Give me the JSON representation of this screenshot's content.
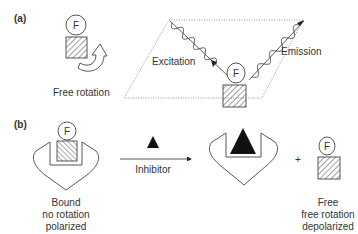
{
  "panel_a": {
    "label": "(a)",
    "free_rotation_label": "Free rotation",
    "fluorophore_label": "F",
    "excitation_label": "Excitation",
    "emission_label": "Emission"
  },
  "panel_b": {
    "label": "(b)",
    "fluorophore_label": "F",
    "arrow_label": "Inhibitor",
    "plus_sign": "+",
    "bound_caption": [
      "Bound",
      "no rotation",
      "polarized"
    ],
    "free_caption": [
      "Free",
      "free rotation",
      "depolarized"
    ]
  },
  "colors": {
    "stroke": "#444444",
    "fill_dark": "#1a1a1a",
    "text": "#333333"
  }
}
